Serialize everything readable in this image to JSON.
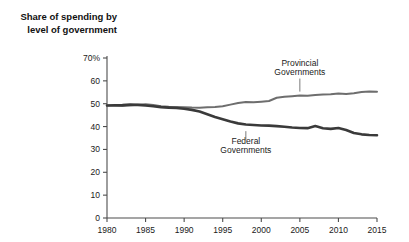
{
  "chart_data": {
    "type": "line",
    "title": "Share of spending by level of government",
    "title_line1": "Share of spending by",
    "title_line2": "level of government",
    "xlabel": "",
    "ylabel": "",
    "xlim": [
      1980,
      2015
    ],
    "ylim": [
      0,
      70
    ],
    "grid": false,
    "legend_position": "inline-annotation",
    "y_ticks": [
      0,
      10,
      20,
      30,
      40,
      50,
      60,
      70
    ],
    "y_tick_labels": [
      "0",
      "10",
      "20",
      "30",
      "40",
      "50",
      "60",
      "70%"
    ],
    "x_ticks": [
      1980,
      1985,
      1990,
      1995,
      2000,
      2005,
      2010,
      2015
    ],
    "x_tick_labels": [
      "1980",
      "1985",
      "1990",
      "1995",
      "2000",
      "2005",
      "2010",
      "2015"
    ],
    "x": [
      1980,
      1981,
      1982,
      1983,
      1984,
      1985,
      1986,
      1987,
      1988,
      1989,
      1990,
      1991,
      1992,
      1993,
      1994,
      1995,
      1996,
      1997,
      1998,
      1999,
      2000,
      2001,
      2002,
      2003,
      2004,
      2005,
      2006,
      2007,
      2008,
      2009,
      2010,
      2011,
      2012,
      2013,
      2014,
      2015
    ],
    "series": [
      {
        "name": "Provincial Governments",
        "color": "#6e6e6e",
        "width": 2.0,
        "label_x": 2005,
        "label_y_top": 66.5,
        "label_y_bottom": 62.5,
        "leader_from": [
          2005,
          61.0
        ],
        "leader_to": [
          2005,
          55.3
        ],
        "values": [
          49.2,
          49.1,
          49.0,
          49.3,
          49.6,
          49.8,
          49.4,
          48.9,
          48.7,
          48.6,
          48.5,
          48.3,
          48.2,
          48.4,
          48.6,
          48.9,
          49.6,
          50.3,
          50.8,
          50.6,
          50.9,
          51.2,
          52.6,
          53.0,
          53.3,
          53.6,
          53.5,
          53.8,
          54.0,
          54.1,
          54.5,
          54.3,
          54.6,
          55.1,
          55.3,
          55.2
        ]
      },
      {
        "name": "Federal Governments",
        "color": "#3a3a3a",
        "width": 2.6,
        "label_x": 1998,
        "label_y_top": 32.5,
        "label_y_bottom": 28.5,
        "leader_from": [
          1998,
          38.0
        ],
        "leader_to": [
          1998,
          34.0
        ],
        "values": [
          49.2,
          49.3,
          49.4,
          49.6,
          49.5,
          49.2,
          48.9,
          48.5,
          48.3,
          48.1,
          47.8,
          47.3,
          46.6,
          45.4,
          44.2,
          43.2,
          42.2,
          41.4,
          40.9,
          40.7,
          40.5,
          40.4,
          40.2,
          39.9,
          39.6,
          39.4,
          39.3,
          40.2,
          39.3,
          39.0,
          39.4,
          38.5,
          37.2,
          36.6,
          36.3,
          36.2
        ]
      }
    ]
  },
  "title_block": {
    "line1": "Share of spending by",
    "line2": "level of government"
  }
}
